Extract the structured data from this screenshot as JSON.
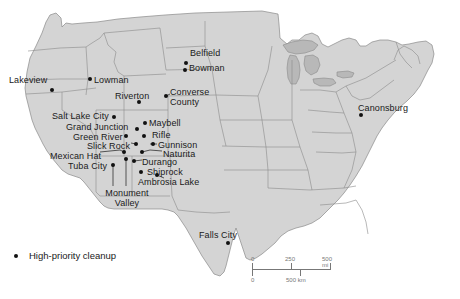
{
  "figure": {
    "background_color": "#ffffff",
    "land_color": "#d4d4d4",
    "water_color": "#b8b8b8",
    "border_color": "#8a8a8a",
    "dot_color": "#111111"
  },
  "legend": {
    "symbol": "filled-circle",
    "label": "High-priority cleanup"
  },
  "scale": {
    "miles": {
      "ticks": [
        "0",
        "250",
        "500 mi"
      ]
    },
    "kilometers": {
      "ticks": [
        "0",
        "500 km"
      ]
    }
  },
  "sites": [
    {
      "name": "Lakeview",
      "label": "Lakeview",
      "dot": {
        "x": 52,
        "y": 90
      },
      "label_pos": {
        "x": 9,
        "y": 76
      },
      "align": "left",
      "lines": 1
    },
    {
      "name": "Lowman",
      "label": "Lowman",
      "dot": {
        "x": 90,
        "y": 79
      },
      "label_pos": {
        "x": 94,
        "y": 76
      },
      "align": "left",
      "lines": 1
    },
    {
      "name": "Belfield",
      "label": "Belfield",
      "dot": {
        "x": 186,
        "y": 63
      },
      "label_pos": {
        "x": 190,
        "y": 49
      },
      "align": "left",
      "lines": 1
    },
    {
      "name": "Bowman",
      "label": "Bowman",
      "dot": {
        "x": 185,
        "y": 70
      },
      "label_pos": {
        "x": 189,
        "y": 64
      },
      "align": "left",
      "lines": 1
    },
    {
      "name": "Riverton",
      "label": "Riverton",
      "dot": {
        "x": 139,
        "y": 102
      },
      "label_pos": {
        "x": 115,
        "y": 92
      },
      "align": "left",
      "lines": 1
    },
    {
      "name": "Converse County",
      "label": "Converse County",
      "dot": {
        "x": 166,
        "y": 96
      },
      "label_pos": {
        "x": 170,
        "y": 88
      },
      "align": "left",
      "lines": 2
    },
    {
      "name": "Canonsburg",
      "label": "Canonsburg",
      "dot": {
        "x": 361,
        "y": 115
      },
      "label_pos": {
        "x": 358,
        "y": 104
      },
      "align": "left",
      "lines": 1
    },
    {
      "name": "Salt Lake City",
      "label": "Salt Lake City",
      "dot": {
        "x": 114,
        "y": 117
      },
      "label_pos": {
        "x": 52,
        "y": 112
      },
      "align": "left",
      "lines": 1
    },
    {
      "name": "Maybell",
      "label": "Maybell",
      "dot": {
        "x": 145,
        "y": 123
      },
      "label_pos": {
        "x": 149,
        "y": 119
      },
      "align": "left",
      "lines": 1
    },
    {
      "name": "Grand Junction",
      "label": "Grand Junction",
      "dot": {
        "x": 137,
        "y": 129
      },
      "label_pos": {
        "x": 66,
        "y": 123
      },
      "align": "left",
      "lines": 1
    },
    {
      "name": "Rifle",
      "label": "Rifle",
      "dot": {
        "x": 144,
        "y": 136
      },
      "label_pos": {
        "x": 152,
        "y": 131
      },
      "align": "left",
      "lines": 1
    },
    {
      "name": "Green River",
      "label": "Green River",
      "dot": {
        "x": 126,
        "y": 136
      },
      "label_pos": {
        "x": 73,
        "y": 133
      },
      "align": "left",
      "lines": 1
    },
    {
      "name": "Gunnison",
      "label": "Gunnison",
      "dot": {
        "x": 153,
        "y": 144
      },
      "label_pos": {
        "x": 158,
        "y": 141
      },
      "align": "left",
      "lines": 1
    },
    {
      "name": "Slick Rock",
      "label": "Slick Rock",
      "dot": {
        "x": 136,
        "y": 144
      },
      "label_pos": {
        "x": 87,
        "y": 142
      },
      "align": "left",
      "lines": 1
    },
    {
      "name": "Naturita",
      "label": "Naturita",
      "dot": {
        "x": 142,
        "y": 152
      },
      "label_pos": {
        "x": 163,
        "y": 150
      },
      "align": "left",
      "lines": 1
    },
    {
      "name": "Mexican Hat",
      "label": "Mexican Hat",
      "dot": {
        "x": 124,
        "y": 152
      },
      "label_pos": {
        "x": 50,
        "y": 152
      },
      "align": "left",
      "lines": 1
    },
    {
      "name": "Durango",
      "label": "Durango",
      "dot": {
        "x": 134,
        "y": 161
      },
      "label_pos": {
        "x": 142,
        "y": 158
      },
      "align": "left",
      "lines": 1
    },
    {
      "name": "Tuba City",
      "label": "Tuba City",
      "dot": {
        "x": 113,
        "y": 165
      },
      "label_pos": {
        "x": 68,
        "y": 162
      },
      "align": "left",
      "lines": 1
    },
    {
      "name": "Shiprock",
      "label": "Shiprock",
      "dot": {
        "x": 141,
        "y": 172
      },
      "label_pos": {
        "x": 147,
        "y": 168
      },
      "align": "left",
      "lines": 1
    },
    {
      "name": "Ambrosia Lake",
      "label": "Ambrosia Lake",
      "dot": {
        "x": 157,
        "y": 175
      },
      "label_pos": {
        "x": 138,
        "y": 178
      },
      "align": "left",
      "lines": 1
    },
    {
      "name": "Monument Valley",
      "label": "Monument Valley",
      "dot": {
        "x": 126,
        "y": 159
      },
      "label_pos": {
        "x": 100,
        "y": 189
      },
      "align": "center",
      "lines": 2
    },
    {
      "name": "Falls City",
      "label": "Falls City",
      "dot": {
        "x": 228,
        "y": 243
      },
      "label_pos": {
        "x": 199,
        "y": 231
      },
      "align": "left",
      "lines": 1
    }
  ]
}
